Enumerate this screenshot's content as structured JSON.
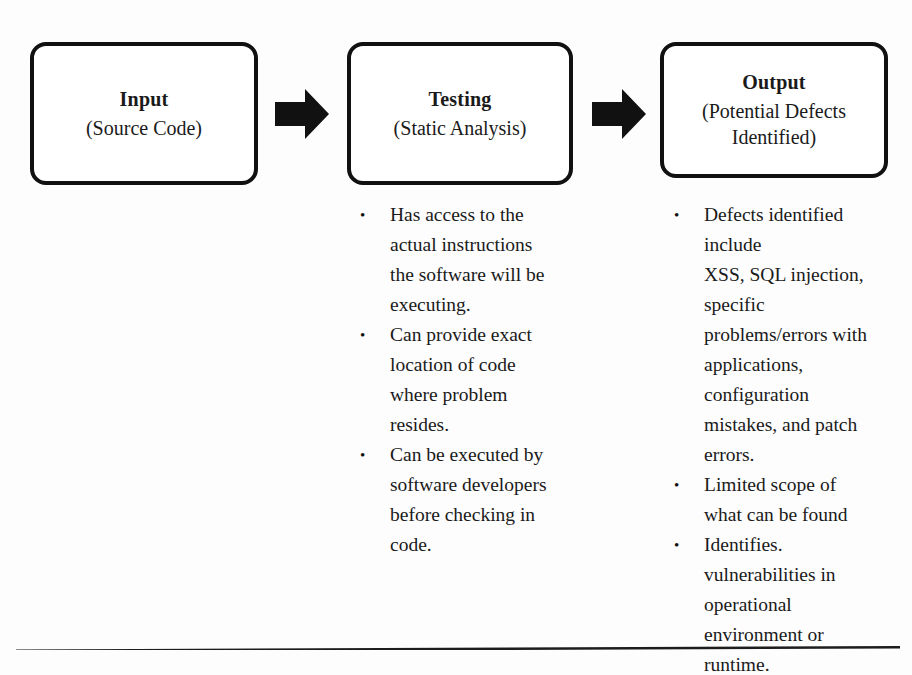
{
  "page": {
    "background_color": "#fdfdfd",
    "ink_color": "#111111"
  },
  "diagram": {
    "type": "process-flow",
    "boxes": [
      {
        "id": "input",
        "title": "Input",
        "subtitle": "(Source Code)"
      },
      {
        "id": "testing",
        "title": "Testing",
        "subtitle": "(Static Analysis)"
      },
      {
        "id": "output",
        "title": "Output",
        "subtitle": "(Potential Defects\nIdentified)"
      }
    ],
    "arrows": [
      {
        "id": "arrow-input-to-testing",
        "icon": "right-block-arrow-icon",
        "direction": "right"
      },
      {
        "id": "arrow-testing-to-output",
        "icon": "right-block-arrow-icon",
        "direction": "right"
      }
    ]
  },
  "columns": {
    "testing": {
      "bullet_marker": "•",
      "items": [
        "Has access to the\nactual instructions\nthe software will be\nexecuting.",
        "Can provide exact\nlocation of code\nwhere problem\nresides.",
        "Can be executed by\nsoftware developers\nbefore checking in\ncode."
      ]
    },
    "output": {
      "bullet_marker": "•",
      "items": [
        "Defects identified\ninclude\nXSS, SQL injection,\nspecific\nproblems/errors with\napplications,\nconfiguration\nmistakes, and patch\nerrors.",
        "Limited scope of\nwhat can be found",
        "Identifies.\nvulnerabilities in\noperational\nenvironment or\nruntime."
      ]
    }
  },
  "footer": {
    "rule": "horizontal-rule"
  }
}
